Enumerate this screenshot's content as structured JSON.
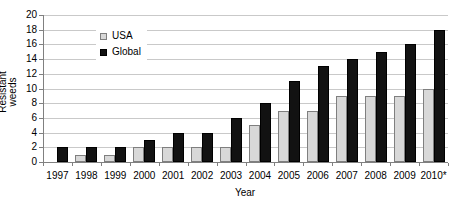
{
  "chart_data": {
    "type": "bar",
    "title": "",
    "xlabel": "Year",
    "ylabel": "Resistant weeds",
    "ylim": [
      0,
      20
    ],
    "ytick_step": 2,
    "grid": true,
    "legend_position": "top-left-inside",
    "categories": [
      "1997",
      "1998",
      "1999",
      "2000",
      "2001",
      "2002",
      "2003",
      "2004",
      "2005",
      "2006",
      "2007",
      "2008",
      "2009",
      "2010*"
    ],
    "series": [
      {
        "name": "USA",
        "color": "#d8d8d8",
        "border": "#7f7f7f",
        "values": [
          0,
          1,
          1,
          2,
          2,
          2,
          2,
          5,
          7,
          7,
          9,
          9,
          9,
          10
        ]
      },
      {
        "name": "Global",
        "color": "#121212",
        "border": "#000000",
        "values": [
          2,
          2,
          2,
          3,
          4,
          4,
          6,
          8,
          11,
          13,
          14,
          15,
          16,
          18
        ]
      }
    ]
  },
  "palette": {
    "background": "#ffffff",
    "gridline": "#c9c9c9",
    "axis": "#808080",
    "text": "#000000"
  }
}
